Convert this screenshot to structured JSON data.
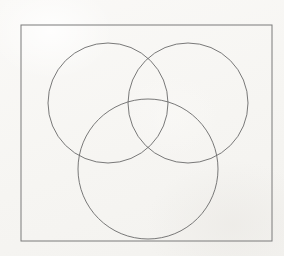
{
  "document": {
    "title": "Three-Circle Venn Diagram",
    "kind": "line-drawing",
    "background_color": "#f8f7f5"
  },
  "figure": {
    "name": "venn-diagram-three-circles",
    "stroke_color": "#6a6a6a",
    "frame_stroke_color": "#7a7a7a",
    "fill": "none",
    "stroke_width": 0.9,
    "frame": {
      "label": "",
      "x": 21,
      "y": 25,
      "width": 251,
      "height": 216
    },
    "circles": [
      {
        "id": "circle-top-left",
        "label": "",
        "cx": 108,
        "cy": 103,
        "r": 60
      },
      {
        "id": "circle-top-right",
        "label": "",
        "cx": 188,
        "cy": 103,
        "r": 60
      },
      {
        "id": "circle-bottom",
        "label": "",
        "cx": 148,
        "cy": 169,
        "r": 70
      }
    ]
  },
  "chart_data": {
    "type": "diagram",
    "title": "",
    "subtitle": "",
    "xlabel": "",
    "ylabel": "",
    "shapes": [
      {
        "type": "rectangle",
        "x": 21,
        "y": 25,
        "width": 251,
        "height": 216,
        "stroke": "#7a7a7a",
        "fill": "none"
      },
      {
        "type": "circle",
        "cx": 108,
        "cy": 103,
        "r": 60,
        "stroke": "#6a6a6a",
        "fill": "none"
      },
      {
        "type": "circle",
        "cx": 188,
        "cy": 103,
        "r": 60,
        "stroke": "#6a6a6a",
        "fill": "none"
      },
      {
        "type": "circle",
        "cx": 148,
        "cy": 169,
        "r": 70,
        "stroke": "#6a6a6a",
        "fill": "none"
      }
    ],
    "annotations": [],
    "legend": []
  }
}
